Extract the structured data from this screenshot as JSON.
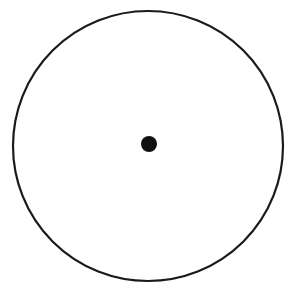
{
  "diagram": {
    "type": "circle-with-center-point",
    "canvas": {
      "width": 290,
      "height": 289,
      "background": "#ffffff"
    },
    "circle": {
      "cx": 148,
      "cy": 146,
      "r": 135,
      "stroke": "#1a1a1a",
      "stroke_width": 2.2,
      "fill": "none"
    },
    "center_point": {
      "cx": 149,
      "cy": 144,
      "r": 8,
      "fill": "#111111"
    },
    "labels": []
  }
}
